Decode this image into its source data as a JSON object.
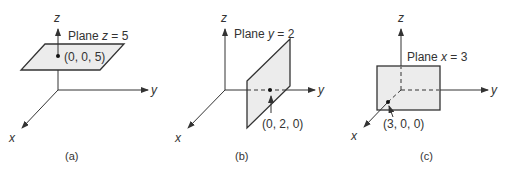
{
  "panels": [
    {
      "id": "a",
      "caption": "(a)",
      "plane_label_prefix": "Plane ",
      "plane_var": "z",
      "plane_eq": " = 5",
      "point_label": "(0, 0, 5)",
      "axes": {
        "x": "x",
        "y": "y",
        "z": "z"
      }
    },
    {
      "id": "b",
      "caption": "(b)",
      "plane_label_prefix": "Plane ",
      "plane_var": "y",
      "plane_eq": " = 2",
      "point_label": "(0, 2, 0)",
      "axes": {
        "x": "x",
        "y": "y",
        "z": "z"
      }
    },
    {
      "id": "c",
      "caption": "(c)",
      "plane_label_prefix": "Plane ",
      "plane_var": "x",
      "plane_eq": " = 3",
      "point_label": "(3, 0, 0)",
      "axes": {
        "x": "x",
        "y": "y",
        "z": "z"
      }
    }
  ],
  "colors": {
    "plane_fill": "#ececec",
    "line": "#333333"
  }
}
